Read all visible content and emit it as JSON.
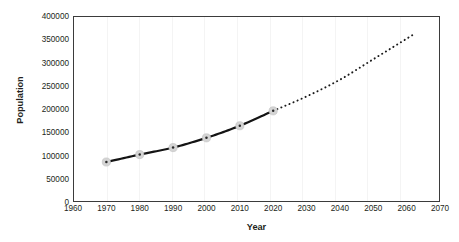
{
  "chart_data": {
    "type": "line",
    "title": "",
    "xlabel": "Year",
    "ylabel": "Population",
    "xlim": [
      1960,
      2070
    ],
    "ylim": [
      0,
      400000
    ],
    "xticks": [
      1960,
      1970,
      1980,
      1990,
      2000,
      2010,
      2020,
      2030,
      2040,
      2050,
      2060,
      2070
    ],
    "yticks": [
      0,
      50000,
      100000,
      150000,
      200000,
      250000,
      300000,
      350000,
      400000
    ],
    "ytick_labels": [
      "0",
      "50000",
      "100000",
      "150000",
      "200000",
      "250000",
      "300000",
      "350000",
      "400000"
    ],
    "xtick_labels": [
      "1960",
      "1970",
      "1980",
      "1990",
      "2000",
      "2010",
      "2020",
      "2030",
      "2040",
      "2050",
      "2060",
      "2070"
    ],
    "grid": "vertical-light",
    "legend": "none",
    "series": [
      {
        "name": "Observed population",
        "style": "solid",
        "color": "#1a1a1a",
        "marker": "circle-gray",
        "x": [
          1970,
          1980,
          1990,
          2000,
          2010,
          2020
        ],
        "values": [
          86000,
          102000,
          117000,
          138000,
          164000,
          196000
        ]
      },
      {
        "name": "Projected population",
        "style": "dotted",
        "color": "#1a1a1a",
        "marker": "none",
        "x": [
          2020,
          2030,
          2040,
          2050,
          2062
        ],
        "values": [
          196000,
          227000,
          263000,
          307000,
          360000
        ]
      }
    ]
  },
  "axes": {
    "x_title": "Year",
    "y_title": "Population"
  }
}
